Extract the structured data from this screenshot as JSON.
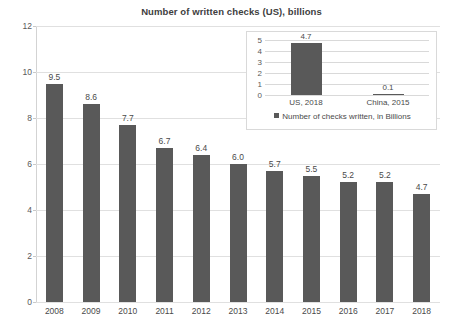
{
  "chart_data": [
    {
      "id": "main",
      "type": "bar",
      "title": "Number of written checks (US), billions",
      "xlabel": "",
      "ylabel": "",
      "categories": [
        "2008",
        "2009",
        "2010",
        "2011",
        "2012",
        "2013",
        "2014",
        "2015",
        "2016",
        "2017",
        "2018"
      ],
      "values": [
        9.5,
        8.6,
        7.7,
        6.7,
        6.4,
        6.0,
        5.7,
        5.5,
        5.2,
        5.2,
        4.7
      ],
      "value_labels": [
        "9.5",
        "8.6",
        "7.7",
        "6.7",
        "6.4",
        "6.0",
        "5.7",
        "5.5",
        "5.2",
        "5.2",
        "4.7"
      ],
      "ylim": [
        0,
        12
      ],
      "yticks": [
        0,
        2,
        4,
        6,
        8,
        10,
        12
      ],
      "ytick_labels": [
        "0",
        "2",
        "4",
        "6",
        "8",
        "10",
        "12"
      ],
      "grid": true,
      "legend": false,
      "series_color": "#595959"
    },
    {
      "id": "inset",
      "type": "bar",
      "title": "",
      "categories": [
        "US, 2018",
        "China, 2015"
      ],
      "values": [
        4.7,
        0.1
      ],
      "value_labels": [
        "4.7",
        "0.1"
      ],
      "ylim": [
        0,
        5
      ],
      "yticks": [
        0,
        1,
        2,
        3,
        4,
        5
      ],
      "ytick_labels": [
        "0",
        "1",
        "2",
        "3",
        "4",
        "5"
      ],
      "grid": true,
      "legend": true,
      "legend_position": "bottom",
      "legend_entries": [
        "Number of checks written, in Billions"
      ],
      "series_color": "#595959"
    }
  ],
  "colors": {
    "bar": "#595959",
    "gridline": "#e0e0e0",
    "inset_border": "#d9d9d9",
    "text": "#4a4a4a",
    "background": "#ffffff"
  }
}
